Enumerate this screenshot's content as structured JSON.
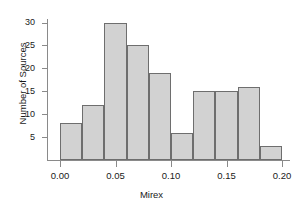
{
  "chart_data": {
    "type": "bar",
    "title": "",
    "subtitle": "",
    "xlabel": "Mirex",
    "ylabel": "Number of Sources",
    "grid": false,
    "legend": null,
    "bin_width": 0.02,
    "bin_edges": [
      0.0,
      0.02,
      0.04,
      0.06,
      0.08,
      0.1,
      0.12,
      0.14,
      0.16,
      0.18,
      0.2
    ],
    "categories": [
      "0.00-0.02",
      "0.02-0.04",
      "0.04-0.06",
      "0.06-0.08",
      "0.08-0.10",
      "0.10-0.12",
      "0.12-0.14",
      "0.14-0.16",
      "0.16-0.18",
      "0.18-0.20"
    ],
    "values": [
      8,
      12,
      30,
      25,
      19,
      6,
      15,
      15,
      16,
      3
    ],
    "xlim": [
      0.0,
      0.2
    ],
    "ylim": [
      0,
      31
    ],
    "xticks": [
      0.0,
      0.05,
      0.1,
      0.15,
      0.2
    ],
    "xtick_labels": [
      "0.00",
      "0.05",
      "0.10",
      "0.15",
      "0.20"
    ],
    "yticks": [
      5,
      10,
      15,
      20,
      25,
      30
    ],
    "ytick_labels": [
      "5",
      "10",
      "15",
      "20",
      "25",
      "30"
    ],
    "bar_fill_color": "#d2d2d2",
    "bar_edge_color": "#6e6e6e",
    "axis_color": "#8a8a8a",
    "background_color": "#ffffff"
  }
}
